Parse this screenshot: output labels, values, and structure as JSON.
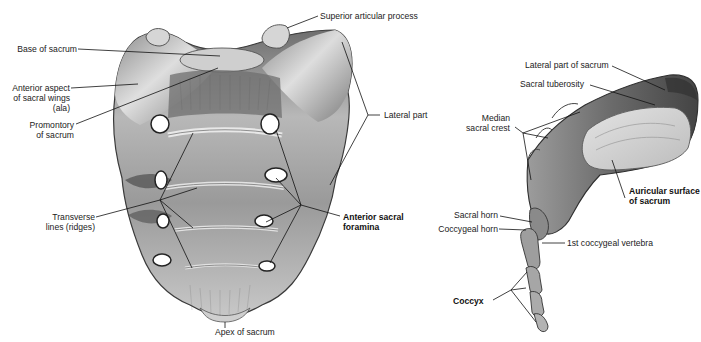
{
  "figure": {
    "views": [
      {
        "name": "anterior-view",
        "subject": "Sacrum and coccyx, anterior (pelvic) surface"
      },
      {
        "name": "lateral-view",
        "subject": "Sacrum and coccyx, lateral view"
      }
    ],
    "colors": {
      "background": "#ffffff",
      "bone_light": "#d9d9d9",
      "bone_mid": "#a9a9a9",
      "bone_dark": "#5e5e5e",
      "leader": "#111111"
    }
  },
  "labels": {
    "anterior": {
      "base_of_sacrum": "Base of sacrum",
      "anterior_aspect_l1": "Anterior aspect",
      "anterior_aspect_l2": "of sacral wings",
      "anterior_aspect_l3": "(ala)",
      "promontory_l1": "Promontory",
      "promontory_l2": "of sacrum",
      "transverse_l1": "Transverse",
      "transverse_l2": "lines (ridges)",
      "superior_articular_process": "Superior articular process",
      "lateral_part": "Lateral part",
      "anterior_foramina_l1": "Anterior sacral",
      "anterior_foramina_l2": "foramina",
      "apex_of_sacrum": "Apex of sacrum"
    },
    "lateral": {
      "lateral_part_of_sacrum": "Lateral part of sacrum",
      "sacral_tuberosity": "Sacral tuberosity",
      "median_crest_l1": "Median",
      "median_crest_l2": "sacral crest",
      "auricular_l1": "Auricular surface",
      "auricular_l2": "of sacrum",
      "sacral_horn": "Sacral horn",
      "coccygeal_horn": "Coccygeal horn",
      "first_coccygeal": "1st coccygeal vertebra",
      "coccyx": "Coccyx"
    }
  }
}
